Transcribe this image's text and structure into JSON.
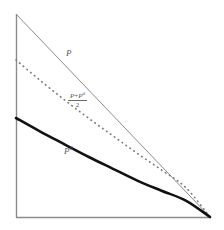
{
  "figure": {
    "background_color": "#ffffff",
    "axis_color": "#8c8c8c",
    "labels": {
      "upper_curve": "P",
      "lower_curve_base": "P",
      "lower_curve_sup": "d",
      "middle_numerator_first": "P",
      "middle_numerator_plus": "+",
      "middle_numerator_second_base": "P",
      "middle_numerator_second_sup": "d",
      "middle_denominator": "2"
    }
  },
  "chart_data": {
    "type": "line",
    "title": "",
    "xlabel": "",
    "ylabel": "",
    "xlim": [
      0,
      1
    ],
    "ylim": [
      0,
      1
    ],
    "grid": false,
    "legend": "inline-annotations",
    "axes": {
      "left_axis": true,
      "bottom_axis": true,
      "top_axis": false,
      "right_axis": false,
      "origin_px": [
        16,
        217
      ],
      "x_end_px": [
        210,
        217
      ],
      "y_top_px": [
        16,
        14
      ]
    },
    "series": [
      {
        "name": "P",
        "label": "P",
        "style": "solid-thin",
        "color": "#8c8c8c",
        "width_px": 1,
        "shape": "straight-line",
        "x": [
          0.0,
          0.25,
          0.5,
          0.75,
          1.0
        ],
        "y": [
          1.0,
          0.75,
          0.5,
          0.25,
          0.0
        ],
        "points_px": [
          [
            16,
            14
          ],
          [
            64.5,
            64.75
          ],
          [
            113,
            115.5
          ],
          [
            161.5,
            166.25
          ],
          [
            210,
            217
          ]
        ]
      },
      {
        "name": "(P+P^d)/2",
        "label": "(P + P^d) / 2",
        "style": "dotted",
        "color": "#7a7a7a",
        "width_px": 1.6,
        "shape": "convex-curve",
        "x": [
          0.0,
          0.125,
          0.25,
          0.375,
          0.5,
          0.625,
          0.75,
          0.875,
          1.0
        ],
        "y": [
          0.765,
          0.66,
          0.56,
          0.465,
          0.375,
          0.285,
          0.2,
          0.11,
          0.0
        ],
        "points_px": [
          [
            16,
            60
          ],
          [
            40.3,
            80.5
          ],
          [
            64.5,
            99.9
          ],
          [
            88.8,
            118.4
          ],
          [
            113,
            135.9
          ],
          [
            137.3,
            153.4
          ],
          [
            161.5,
            170.0
          ],
          [
            185.8,
            187.6
          ],
          [
            210,
            217
          ]
        ]
      },
      {
        "name": "P^d",
        "label": "P^d",
        "style": "solid-thick",
        "color": "#111111",
        "width_px": 2.6,
        "shape": "convex-curve",
        "x": [
          0.0,
          0.125,
          0.25,
          0.375,
          0.5,
          0.625,
          0.75,
          0.875,
          1.0
        ],
        "y": [
          0.5,
          0.425,
          0.355,
          0.285,
          0.22,
          0.155,
          0.1,
          0.045,
          0.0
        ],
        "points_px": [
          [
            16,
            118
          ],
          [
            40.3,
            131.6
          ],
          [
            64.5,
            144.3
          ],
          [
            88.8,
            157.0
          ],
          [
            113,
            168.8
          ],
          [
            137.3,
            180.6
          ],
          [
            161.5,
            190.7
          ],
          [
            185.8,
            200.6
          ],
          [
            210,
            217
          ]
        ]
      }
    ],
    "annotations": [
      {
        "text": "P",
        "x_px": 66,
        "y_px": 49,
        "series": "P"
      },
      {
        "text": "(P+P^d)/2",
        "x_px": 68,
        "y_px": 92,
        "series": "(P+P^d)/2"
      },
      {
        "text": "P^d",
        "x_px": 64,
        "y_px": 147,
        "series": "P^d"
      }
    ]
  }
}
